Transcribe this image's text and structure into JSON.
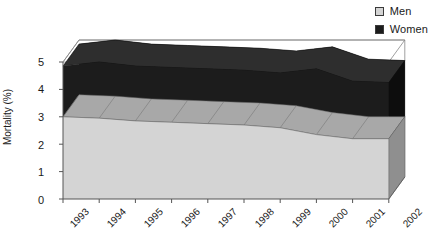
{
  "chart_data": {
    "type": "area",
    "title": "",
    "xlabel": "",
    "ylabel": "Mortality (%)",
    "categories": [
      "1993",
      "1994",
      "1995",
      "1996",
      "1997",
      "1998",
      "1999",
      "2000",
      "2001",
      "2002"
    ],
    "ylim": [
      0,
      5
    ],
    "yticks": [
      0,
      1,
      2,
      3,
      4,
      5
    ],
    "stacked": true,
    "three_d": true,
    "grid": false,
    "legend_position": "top-right",
    "series": [
      {
        "name": "Men",
        "color": "#d4d4d4",
        "values": [
          3.0,
          2.95,
          2.85,
          2.8,
          2.75,
          2.7,
          2.6,
          2.35,
          2.2,
          2.2
        ]
      },
      {
        "name": "Women",
        "color": "#1c1c1c",
        "values": [
          1.85,
          2.05,
          2.0,
          2.0,
          2.0,
          2.0,
          2.0,
          2.4,
          2.1,
          2.05
        ]
      }
    ],
    "stack_totals": [
      4.85,
      5.0,
      4.85,
      4.8,
      4.75,
      4.7,
      4.6,
      4.75,
      4.3,
      4.25
    ]
  },
  "legend": {
    "items": [
      {
        "label": "Men",
        "swatch_color": "#d4d4d4",
        "icon": "square-swatch-icon"
      },
      {
        "label": "Women",
        "swatch_color": "#1c1c1c",
        "icon": "square-swatch-icon"
      }
    ]
  },
  "axes": {
    "y_title": "Mortality (%)",
    "y_tick_labels": [
      "5",
      "4",
      "3",
      "2",
      "1",
      "0"
    ],
    "x_tick_labels": [
      "1993",
      "1994",
      "1995",
      "1996",
      "1997",
      "1998",
      "1999",
      "2000",
      "2001",
      "2002"
    ]
  },
  "colors": {
    "men_fill": "#d4d4d4",
    "men_top": "#a8a8a8",
    "men_side": "#8f8f8f",
    "women_fill": "#1c1c1c",
    "women_top": "#2e2e2e",
    "women_side": "#0d0d0d",
    "axis": "#555555",
    "frame": "#888888",
    "text": "#1a1a1a",
    "background": "#ffffff"
  }
}
